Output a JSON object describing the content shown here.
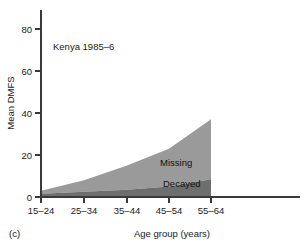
{
  "panel": {
    "id_label": "(c)",
    "annotation": "Kenya 1985–6"
  },
  "axes": {
    "ylabel": "Mean DMFS",
    "xlabel": "Age group (years)",
    "yticks": [
      "0",
      "20",
      "40",
      "60",
      "80"
    ],
    "xticks": [
      "15–24",
      "25–34",
      "35–44",
      "45–54",
      "55–64"
    ]
  },
  "series_labels": {
    "missing": "Missing",
    "decayed": "Decayed"
  },
  "colors": {
    "missing": "#9a9a9a",
    "decayed": "#6e6e6e",
    "axis": "#3a3a3a",
    "text": "#1a1a1a",
    "background": "#ffffff"
  },
  "chart_data": {
    "type": "area",
    "title": "",
    "subtitle": "Kenya 1985–6",
    "xlabel": "Age group (years)",
    "ylabel": "Mean DMFS",
    "categories": [
      "15–24",
      "25–34",
      "35–44",
      "45–54",
      "55–64"
    ],
    "stacked": true,
    "series": [
      {
        "name": "Decayed",
        "values": [
          1.5,
          2.5,
          3.5,
          5.0,
          8.5
        ],
        "color": "#6e6e6e"
      },
      {
        "name": "Missing",
        "values": [
          1.5,
          5.5,
          11.5,
          18.0,
          28.5
        ],
        "color": "#9a9a9a"
      }
    ],
    "cumulative_totals": [
      3.0,
      8.0,
      15.0,
      23.0,
      37.0
    ],
    "ylim": [
      0,
      88
    ],
    "ytick_values": [
      0,
      20,
      40,
      60,
      80
    ],
    "grid": false,
    "legend": "inline-labels"
  }
}
